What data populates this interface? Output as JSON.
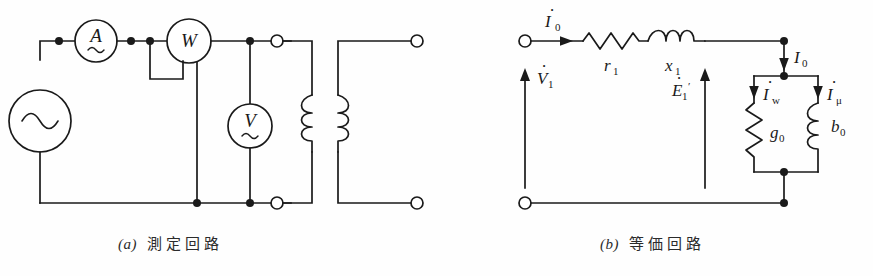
{
  "figure": {
    "width": 873,
    "height": 276,
    "background": "#ffffff",
    "ink_color": "#1a1a1a"
  },
  "panels": [
    {
      "id": "a",
      "caption_marker": "(a)",
      "caption_text": "測定回路",
      "caption_meaning": "measurement circuit",
      "components": {
        "source": {
          "name": "ac-source",
          "symbol": "~"
        },
        "ammeter": {
          "name": "ammeter",
          "label": "A",
          "ac_mark": "~"
        },
        "wattmeter": {
          "name": "wattmeter",
          "label": "W",
          "ac_mark": ""
        },
        "voltmeter": {
          "name": "voltmeter",
          "label": "V",
          "ac_mark": "~"
        },
        "transformer": {
          "name": "transformer",
          "primary_turns": 2,
          "secondary_turns": 2
        },
        "terminals_open": 4
      }
    },
    {
      "id": "b",
      "caption_marker": "(b)",
      "caption_text": "等価回路",
      "caption_meaning": "equivalent circuit",
      "labels": {
        "input_current": "I",
        "input_current_sub": "0",
        "input_current_dot": true,
        "resistance": "r",
        "resistance_sub": "1",
        "reactance": "x",
        "reactance_sub": "1",
        "voltage": "V",
        "voltage_sub": "1",
        "voltage_dot": true,
        "emf": "E",
        "emf_sub": "1",
        "emf_prime": "′",
        "emf_dot": true,
        "branch_current": "I",
        "branch_current_sub": "0",
        "branch_current_dot": false,
        "core_loss_current": "I",
        "core_loss_current_sub": "w",
        "core_loss_current_dot": true,
        "magnetizing_current": "I",
        "magnetizing_current_sub": "μ",
        "magnetizing_current_dot": true,
        "conductance": "g",
        "conductance_sub": "0",
        "susceptance": "b",
        "susceptance_sub": "0"
      },
      "components": {
        "resistor_r1": {
          "name": "resistor",
          "zigzags": 4
        },
        "inductor_x1": {
          "name": "inductor",
          "turns": 2
        },
        "resistor_g0": {
          "name": "shunt-resistor",
          "zigzags": 4
        },
        "inductor_b0": {
          "name": "shunt-inductor",
          "turns": 3
        },
        "terminals_open": 2
      }
    }
  ]
}
